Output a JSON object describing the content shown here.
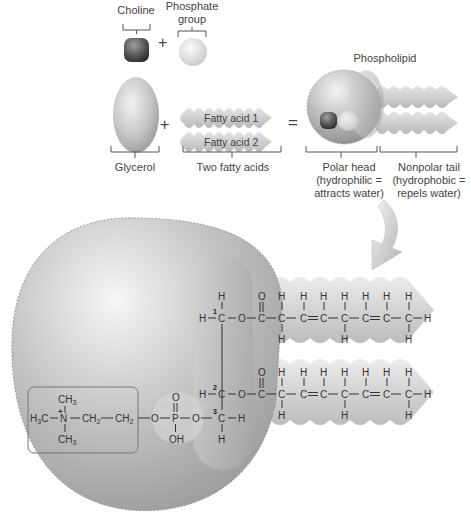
{
  "top": {
    "choline_label": "Choline",
    "phosphate_label_line1": "Phosphate",
    "phosphate_label_line2": "group",
    "plus_1": "+",
    "plus_2": "+",
    "equals": "=",
    "fatty_acid_1": "Fatty acid 1",
    "fatty_acid_2": "Fatty acid 2",
    "glycerol_label": "Glycerol",
    "two_fatty_acids_label": "Two fatty acids",
    "phospholipid_label": "Phospholipid",
    "polar_head_line1": "Polar head",
    "polar_head_line2": "(hydrophilic =",
    "polar_head_line3": "attracts water)",
    "nonpolar_tail_line1": "Nonpolar tail",
    "nonpolar_tail_line2": "(hydrophobic =",
    "nonpolar_tail_line3": "repels water)"
  },
  "structure": {
    "choline_group": {
      "top": "CH3",
      "left": "H3C",
      "center": "N",
      "charge": "+",
      "bottom": "CH3",
      "chain1": "CH2",
      "chain2": "CH2"
    },
    "phosphate_group": {
      "o_left": "O",
      "p": "P",
      "o_top": "O",
      "oh": "OH",
      "o_right": "O"
    },
    "glycerol_backbone": {
      "carbon_numbers": [
        "1",
        "2",
        "3"
      ]
    },
    "fatty_acid_chain_1": [
      "C",
      "C",
      "C",
      "C",
      "C",
      "C",
      "C",
      "H"
    ],
    "fatty_acid_chain_2": [
      "C",
      "C",
      "C",
      "C",
      "C",
      "C",
      "C",
      "H"
    ]
  },
  "colors": {
    "head_gray": "#b8b8b8",
    "tail_gray": "#cfcfcf",
    "choline_dark": "#5a5a5a",
    "text": "#333333"
  }
}
